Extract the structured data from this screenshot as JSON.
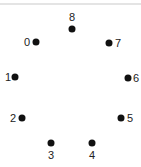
{
  "puzzle": {
    "type": "connect-the-dots",
    "points": [
      {
        "id": "0",
        "label": "0",
        "x": 36,
        "y": 42,
        "lx": 27,
        "ly": 42
      },
      {
        "id": "1",
        "label": "1",
        "x": 15,
        "y": 77,
        "lx": 8,
        "ly": 77
      },
      {
        "id": "2",
        "label": "2",
        "x": 22,
        "y": 118,
        "lx": 13,
        "ly": 118
      },
      {
        "id": "3",
        "label": "3",
        "x": 51,
        "y": 143,
        "lx": 51,
        "ly": 155
      },
      {
        "id": "4",
        "label": "4",
        "x": 92,
        "y": 143,
        "lx": 92,
        "ly": 155
      },
      {
        "id": "5",
        "label": "5",
        "x": 121,
        "y": 118,
        "lx": 130,
        "ly": 118
      },
      {
        "id": "6",
        "label": "6",
        "x": 128,
        "y": 78,
        "lx": 136,
        "ly": 78
      },
      {
        "id": "7",
        "label": "7",
        "x": 109,
        "y": 43,
        "lx": 118,
        "ly": 43
      },
      {
        "id": "8",
        "label": "8",
        "x": 72,
        "y": 29,
        "lx": 72,
        "ly": 17
      }
    ]
  },
  "colors": {
    "dot": "#111111",
    "label": "#222222",
    "rule": "#e4e4e4",
    "background": "#ffffff"
  }
}
